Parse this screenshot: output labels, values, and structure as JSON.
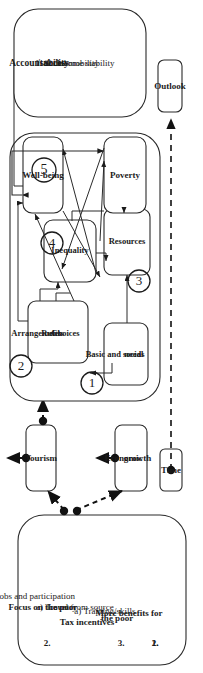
{
  "figure": {
    "type": "systems-causal-loop-diagram",
    "orientation": "rotated-90-ccw",
    "ink_color": "#1b1b1b",
    "box_fill": "#ffffff"
  },
  "policy_panel": {
    "name": "policy-interventions-panel",
    "items": [
      {
        "number": "1.",
        "title": "Tax incentives",
        "sub": "a) Travel from source",
        "sub2": "country"
      },
      {
        "number": "2.",
        "title": "Focus on the poor",
        "sub": "a) Jobs and participation",
        "sub2": ""
      },
      {
        "number": "3.",
        "title": "More benefits for",
        "title2": "the poor",
        "sub": "a) Training/skills",
        "sub2": ""
      }
    ]
  },
  "drivers": {
    "tourism": "Tourism",
    "economic_growth_line1": "Economic",
    "economic_growth_line2": "growth",
    "time": "Time"
  },
  "system_core": {
    "basic_needs_line1": "Basic and social",
    "basic_needs_line2": "needs",
    "arrangements": {
      "bullets": [
        "Arrangements",
        "Rules",
        "Choices"
      ]
    },
    "inequality": "Inequality",
    "resources": "Resources",
    "wellbeing": "Well-being",
    "poverty": "Poverty",
    "markers": [
      "1",
      "2",
      "3",
      "4",
      "5"
    ]
  },
  "outcomes_panel": {
    "name": "accountability-success-panel",
    "heading_line1": "Accountability",
    "heading_line2": "/success",
    "items": [
      "1. Social mobility",
      "2. Income stability"
    ]
  },
  "outlook": {
    "label": "Outlook"
  }
}
